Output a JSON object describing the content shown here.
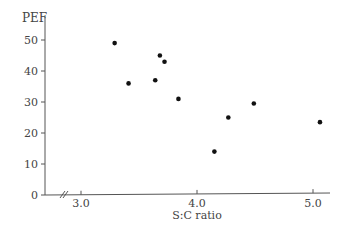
{
  "chart_data": {
    "type": "scatter",
    "title": "",
    "xlabel": "S:C ratio",
    "ylabel": "PEF",
    "xlim": [
      2.7,
      5.15
    ],
    "ylim": [
      0,
      55
    ],
    "x_ticks": [
      3.0,
      4.0,
      5.0
    ],
    "x_tick_labels": [
      "3.0",
      "4.0",
      "5.0"
    ],
    "y_ticks": [
      0,
      10,
      20,
      30,
      40,
      50
    ],
    "y_tick_labels": [
      "0",
      "10",
      "20",
      "30",
      "40",
      "50"
    ],
    "x_axis_break": true,
    "grid": false,
    "legend": null,
    "series": [
      {
        "name": "PEF vs S:C ratio",
        "points": [
          {
            "x": 3.29,
            "y": 49
          },
          {
            "x": 3.41,
            "y": 36
          },
          {
            "x": 3.64,
            "y": 37
          },
          {
            "x": 3.68,
            "y": 45
          },
          {
            "x": 3.72,
            "y": 43
          },
          {
            "x": 3.84,
            "y": 31
          },
          {
            "x": 4.15,
            "y": 14
          },
          {
            "x": 4.27,
            "y": 25
          },
          {
            "x": 4.49,
            "y": 29.5
          },
          {
            "x": 5.06,
            "y": 23.5
          }
        ]
      }
    ]
  }
}
